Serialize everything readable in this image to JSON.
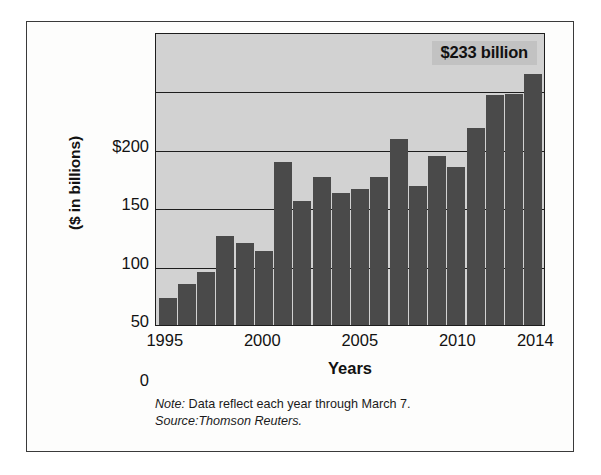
{
  "chart_data": {
    "type": "bar",
    "title": "",
    "xlabel": "Years",
    "ylabel": "($ in billions)",
    "ylim": [
      0,
      250
    ],
    "grid": true,
    "legend": "none",
    "categories": [
      "1995",
      "1996",
      "1997",
      "1998",
      "1999",
      "2000",
      "2001",
      "2002",
      "2003",
      "2004",
      "2005",
      "2006",
      "2007",
      "2008",
      "2009",
      "2010",
      "2011",
      "2012",
      "2013",
      "2014"
    ],
    "values": [
      23,
      35,
      45,
      76,
      70,
      63,
      139,
      106,
      126,
      113,
      116,
      126,
      159,
      119,
      144,
      135,
      168,
      196,
      197,
      214
    ],
    "y_ticks": [
      0,
      50,
      100,
      150,
      200
    ],
    "y_tick_labels": [
      "0",
      "50",
      "100",
      "150",
      "$200"
    ],
    "x_tick_labels": [
      "1995",
      "2000",
      "2005",
      "2010",
      "2014"
    ],
    "x_tick_categories": [
      "1995",
      "2000",
      "2005",
      "2010",
      "2014"
    ],
    "annotations": [
      {
        "text": "$233 billion",
        "target_category": "2014"
      }
    ],
    "colors": {
      "bar": "#4a4a4a",
      "plot_background": "#d2d2d2",
      "gridline": "#1d1d1d",
      "annotation_background": "#c2c2c2",
      "card_background": "#fdfdfc",
      "card_border": "#3a3a3a",
      "text": "#121212"
    }
  },
  "axis": {
    "y_title": "($ in billions)",
    "x_title": "Years"
  },
  "annotation": {
    "value_callout": "$233 billion"
  },
  "footnotes": {
    "note_key": "Note:",
    "note_text": " Data reflect each year through March 7.",
    "source_text": "Source:Thomson Reuters."
  }
}
